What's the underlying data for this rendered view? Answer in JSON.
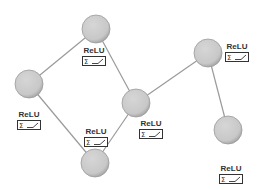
{
  "diagram": {
    "type": "neural-network-graph",
    "node_color": "#cfcfcf",
    "node_stroke": "#9a9a9a",
    "edge_color": "#9a9a9a",
    "nodes": [
      {
        "id": "n1",
        "x": 96,
        "y": 29,
        "r": 14,
        "activation": "ReLU",
        "label_x": 80,
        "label_y": 46
      },
      {
        "id": "n2",
        "x": 29,
        "y": 84,
        "r": 14,
        "activation": "ReLU",
        "label_x": 15,
        "label_y": 110
      },
      {
        "id": "n3",
        "x": 208,
        "y": 53,
        "r": 14,
        "activation": "ReLU",
        "label_x": 223,
        "label_y": 42
      },
      {
        "id": "n4",
        "x": 136,
        "y": 103,
        "r": 14,
        "activation": "ReLU",
        "label_x": 137,
        "label_y": 119
      },
      {
        "id": "n5",
        "x": 95,
        "y": 163,
        "r": 14,
        "activation": "ReLU",
        "label_x": 82,
        "label_y": 127
      },
      {
        "id": "n6",
        "x": 228,
        "y": 130,
        "r": 14,
        "activation": "ReLU",
        "label_x": 217,
        "label_y": 164
      }
    ],
    "edges": [
      {
        "from": "n1",
        "to": "n2"
      },
      {
        "from": "n1",
        "to": "n4"
      },
      {
        "from": "n2",
        "to": "n5"
      },
      {
        "from": "n4",
        "to": "n5"
      },
      {
        "from": "n4",
        "to": "n3"
      },
      {
        "from": "n3",
        "to": "n6"
      }
    ],
    "labels": {
      "n1": "ReLU",
      "n2": "ReLU",
      "n3": "ReLU",
      "n4": "ReLU",
      "n5": "ReLU",
      "n6": "ReLU"
    },
    "activation_icon": "sum-relu-icon"
  }
}
